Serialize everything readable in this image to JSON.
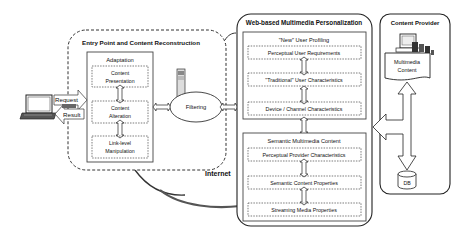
{
  "entry_point": {
    "title": "Entry Point and Content Reconstruction",
    "adaptation": {
      "title": "Adaptation",
      "items": [
        {
          "line1": "Content",
          "line2": "Presentation"
        },
        {
          "line1": "Content",
          "line2": "Alteration"
        },
        {
          "line1": "Link-level",
          "line2": "Manipulation"
        }
      ]
    },
    "filtering": "Filtering"
  },
  "client": {
    "request": "Request",
    "result": "Result"
  },
  "internet_label": "Internet",
  "personalization": {
    "title": "Web-based Multimedia Personalization",
    "user_profiling": {
      "title": "\"New\" User Profiling",
      "items": [
        "Perceptual User Requirements",
        "\"Traditional\" User Characteristics",
        "Device / Channel Characteristics"
      ]
    },
    "semantic_content": {
      "title": "Semantic Multimedia Content",
      "items": [
        "Perceptual Provider Characteristics",
        "Semantic Content Properties",
        "Streaming Media Properties"
      ]
    }
  },
  "content_provider": {
    "title": "Content Provider",
    "content_line1": "Multimedia",
    "content_line2": "Content",
    "db": "DB"
  }
}
